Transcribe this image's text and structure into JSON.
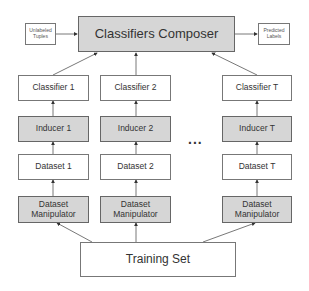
{
  "diagram": {
    "composer": {
      "label": "Classifiers Composer"
    },
    "input": {
      "label": "Unlabeled Tuples"
    },
    "output": {
      "label": "Predicted Labels"
    },
    "ellipsis": "...",
    "training_set": {
      "label": "Training Set"
    },
    "columns": [
      {
        "classifier": "Classifier 1",
        "inducer": "Inducer 1",
        "dataset": "Dataset 1",
        "manipulator": "Dataset Manipulator"
      },
      {
        "classifier": "Classifier 2",
        "inducer": "Inducer 2",
        "dataset": "Dataset 2",
        "manipulator": "Dataset Manipulator"
      },
      {
        "classifier": "Classifier T",
        "inducer": "Inducer T",
        "dataset": "Dataset T",
        "manipulator": "Dataset Manipulator"
      }
    ],
    "colors": {
      "gray_box": "#d6d6d6",
      "border": "#777777",
      "arrow": "#444444"
    }
  }
}
